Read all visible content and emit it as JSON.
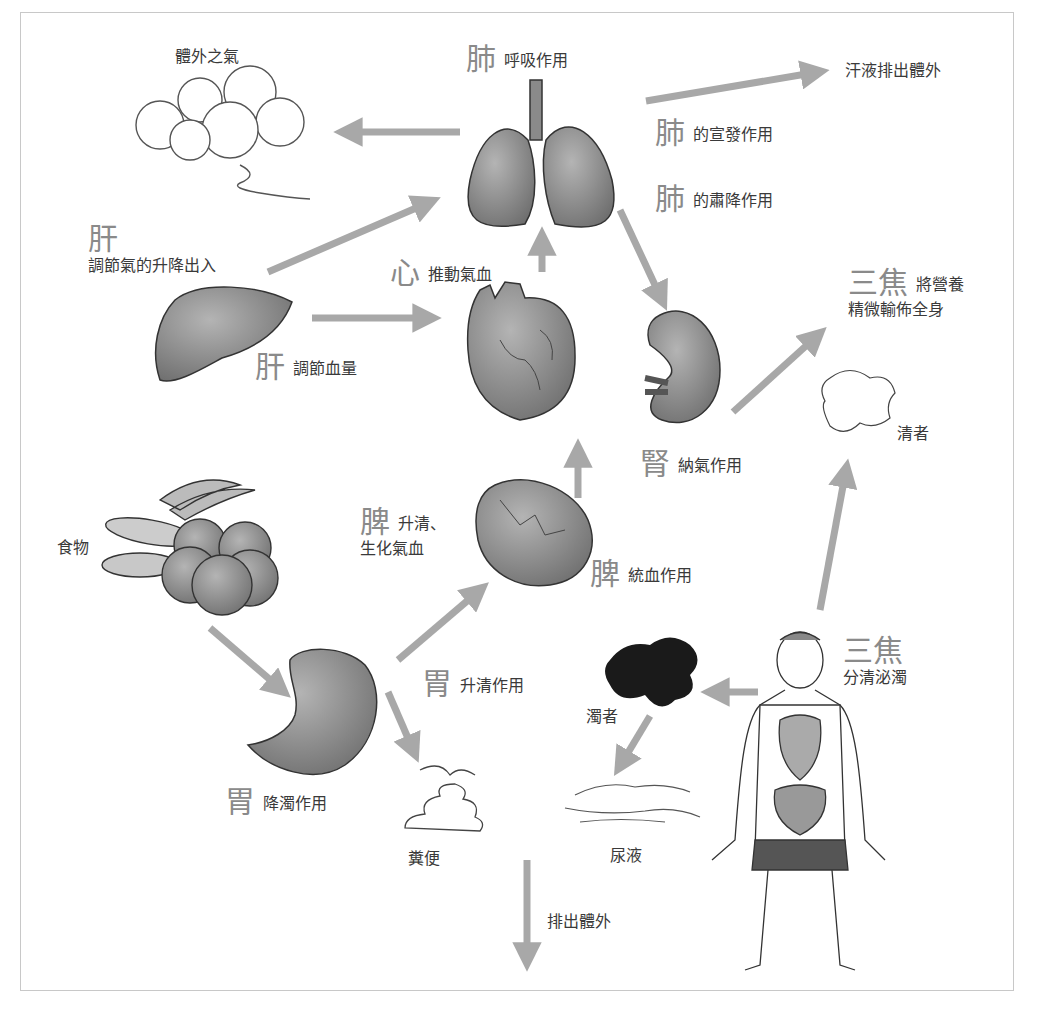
{
  "diagram": {
    "title": "",
    "colors": {
      "arrow": "#a8a8a8",
      "organ_fill": "#8d8d8d",
      "organ_stroke": "#3a3a3a",
      "label_big": "#8a8a8a",
      "label_text": "#3a3a3a",
      "frame": "#c8c8c8",
      "turbid": "#1a1a1a"
    },
    "nodes": {
      "external_qi": {
        "text": "體外之氣"
      },
      "lung_breath": {
        "organ": "肺",
        "text": "呼吸作用"
      },
      "sweat": {
        "text": "汗液排出體外"
      },
      "lung_dispersing": {
        "organ": "肺",
        "text": "的宣發作用"
      },
      "lung_descending": {
        "organ": "肺",
        "text": "的肅降作用"
      },
      "liver_qi": {
        "organ": "肝",
        "text": "調節氣的升降出入"
      },
      "heart": {
        "organ": "心",
        "text": "推動氣血"
      },
      "liver_blood": {
        "organ": "肝",
        "text": "調節血量"
      },
      "sanjiao_nourish": {
        "organ": "三焦",
        "text": "將營養",
        "text2": "精微輸佈全身"
      },
      "clear": {
        "text": "清者"
      },
      "kidney": {
        "organ": "腎",
        "text": "納氣作用"
      },
      "food": {
        "text": "食物"
      },
      "spleen_rise": {
        "organ": "脾",
        "text": "升清、",
        "text2": "生化氣血"
      },
      "spleen_blood": {
        "organ": "脾",
        "text": "統血作用"
      },
      "stomach_rise": {
        "organ": "胃",
        "text": "升清作用"
      },
      "sanjiao_separate": {
        "organ": "三焦",
        "text": "分清泌濁"
      },
      "turbid": {
        "text": "濁者"
      },
      "stomach_descend": {
        "organ": "胃",
        "text": "降濁作用"
      },
      "feces": {
        "text": "糞便"
      },
      "urine": {
        "text": "尿液"
      },
      "excrete": {
        "text": "排出體外"
      }
    },
    "edges": [
      {
        "from": "lung",
        "to": "external_qi"
      },
      {
        "from": "lung",
        "to": "sweat"
      },
      {
        "from": "liver",
        "to": "lung"
      },
      {
        "from": "liver",
        "to": "heart"
      },
      {
        "from": "heart",
        "to": "lung"
      },
      {
        "from": "lung",
        "to": "kidney"
      },
      {
        "from": "kidney",
        "to": "sanjiao_nourish"
      },
      {
        "from": "spleen",
        "to": "heart"
      },
      {
        "from": "stomach",
        "to": "spleen"
      },
      {
        "from": "food",
        "to": "stomach"
      },
      {
        "from": "stomach",
        "to": "feces"
      },
      {
        "from": "human_figure",
        "to": "turbid"
      },
      {
        "from": "turbid",
        "to": "urine"
      },
      {
        "from": "human_figure",
        "to": "clear"
      },
      {
        "from": "center_bottom",
        "to": "excrete"
      }
    ]
  }
}
